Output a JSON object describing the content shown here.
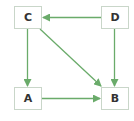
{
  "diagram": {
    "type": "directed-graph",
    "colors": {
      "edge": "#6aab6a",
      "node_border": "#c9d6c9",
      "node_fill": "#ffffff",
      "label": "#333333"
    },
    "nodes": [
      {
        "id": "C",
        "label": "C",
        "x": 14,
        "y": 6
      },
      {
        "id": "D",
        "label": "D",
        "x": 101,
        "y": 6
      },
      {
        "id": "A",
        "label": "A",
        "x": 14,
        "y": 87
      },
      {
        "id": "B",
        "label": "B",
        "x": 101,
        "y": 87
      }
    ],
    "edges": [
      {
        "from": "D",
        "to": "C"
      },
      {
        "from": "C",
        "to": "A"
      },
      {
        "from": "C",
        "to": "B"
      },
      {
        "from": "D",
        "to": "B"
      },
      {
        "from": "A",
        "to": "B"
      }
    ]
  }
}
